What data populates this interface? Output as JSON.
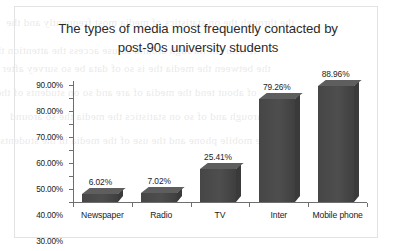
{
  "chart_data": {
    "type": "bar",
    "title": "The types of media most frequently contacted by post-90s university students",
    "title_line1": "The types of media most frequently contacted by",
    "title_line2": "post-90s university students",
    "categories": [
      "Newspaper",
      "Radio",
      "TV",
      "Inter",
      "Mobile phone"
    ],
    "values": [
      6.02,
      7.02,
      25.41,
      79.26,
      88.96
    ],
    "value_labels": [
      "6.02%",
      "7.02%",
      "25.41%",
      "79.26%",
      "88.96%"
    ],
    "xlabel": "",
    "ylabel": "",
    "ylim": [
      0,
      90
    ],
    "y_tick_values": [
      0,
      10,
      20,
      30,
      40,
      50,
      60,
      70,
      80,
      90
    ],
    "y_tick_labels": [
      "0.00%",
      "10.00%",
      "20.00%",
      "30.00%",
      "40.00%",
      "50.00%",
      "60.00%",
      "70.00%",
      "80.00%",
      "90.00%"
    ],
    "grid": false,
    "legend": false,
    "series_color": "#4a4a4a",
    "axis_color": "#6e6e6e",
    "text_color": "#222222",
    "border_color": "#e3e3e3",
    "background": "#ffffff"
  },
  "bleed_text": {
    "lines": [
      "the through the on statistics of media most frequently and the",
      "it with fill through around so use access the attention the",
      "the between the media the is so of data be so survey after",
      "of about tend the media of are and so on students of the",
      "a through and of so on statistics the media the so around",
      "the mobile phone and the use of the media in the students"
    ]
  }
}
